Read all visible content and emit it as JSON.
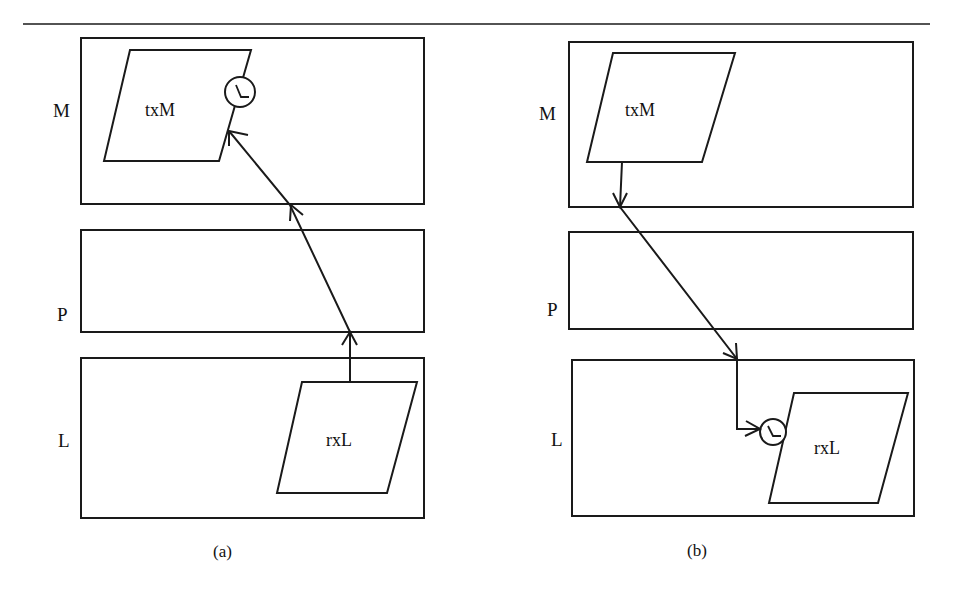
{
  "figure": {
    "panels": [
      {
        "caption": "(a)",
        "layers": [
          {
            "label": "M"
          },
          {
            "label": "P"
          },
          {
            "label": "L"
          }
        ],
        "nodes": {
          "top": {
            "label": "txM",
            "has_timer": true
          },
          "bottom": {
            "label": "rxL",
            "has_timer": false
          }
        },
        "flow": "rxL → P → M → txM (timer at txM)"
      },
      {
        "caption": "(b)",
        "layers": [
          {
            "label": "M"
          },
          {
            "label": "P"
          },
          {
            "label": "L"
          }
        ],
        "nodes": {
          "top": {
            "label": "txM",
            "has_timer": false
          },
          "bottom": {
            "label": "rxL",
            "has_timer": true
          }
        },
        "flow": "txM → M → P → L → rxL (timer at rxL)"
      }
    ],
    "colors": {
      "stroke": "#1a1a1a",
      "background": "#ffffff"
    }
  }
}
